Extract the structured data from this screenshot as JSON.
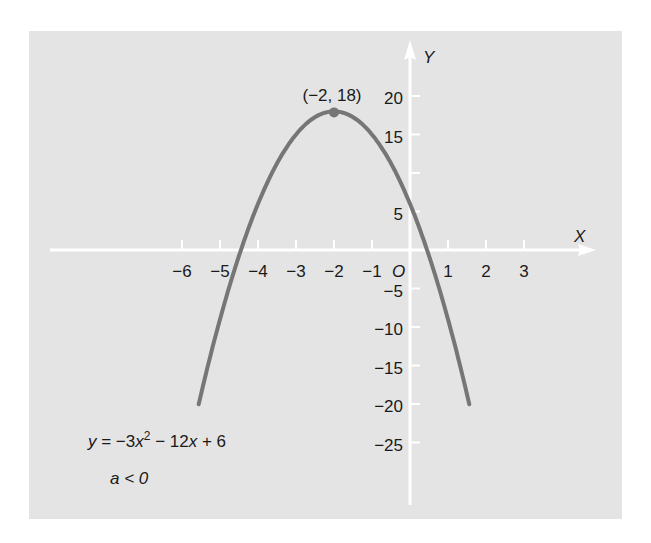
{
  "chart_data": {
    "type": "line",
    "title": "",
    "equation": "y = −3x² − 12x + 6",
    "condition": "a < 0",
    "xlabel": "X",
    "ylabel": "Y",
    "origin_label": "O",
    "vertex": {
      "x": -2,
      "y": 18,
      "label": "(−2, 18)"
    },
    "xlim": [
      -6.5,
      4.5
    ],
    "ylim": [
      -33,
      27
    ],
    "x_ticks": [
      -6,
      -5,
      -4,
      -3,
      -2,
      -1,
      1,
      2,
      3
    ],
    "x_tick_labels": [
      "−6",
      "−5",
      "−4",
      "−3",
      "−2",
      "−1",
      "1",
      "2",
      "3"
    ],
    "y_ticks": [
      20,
      15,
      5,
      -5,
      -10,
      -15,
      -20,
      -25
    ],
    "y_tick_labels": [
      "20",
      "15",
      "5",
      "−5",
      "−10",
      "−15",
      "−20",
      "−25"
    ],
    "y_unlabeled_ticks": [
      10
    ],
    "curve": {
      "a": -3,
      "b": -12,
      "c": 6,
      "x_range": [
        -5.56,
        1.56
      ],
      "color": "#767676"
    },
    "series": [
      {
        "name": "y = -3x^2 - 12x + 6",
        "x": [
          -5.56,
          -5,
          -4,
          -3,
          -2,
          -1,
          0,
          1,
          1.56
        ],
        "y": [
          -20,
          -9,
          6,
          15,
          18,
          15,
          6,
          -9,
          -20
        ]
      }
    ],
    "grid": false,
    "legend": null
  },
  "colors": {
    "background": "#e4e4e4",
    "axes": "#ffffff",
    "curve": "#767676",
    "text": "#1a1a1a"
  }
}
